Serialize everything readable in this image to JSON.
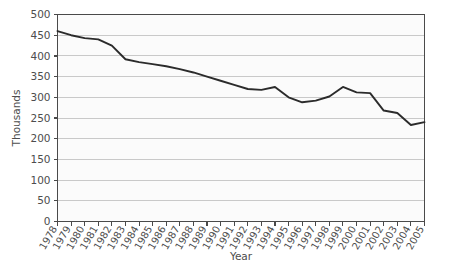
{
  "chart_data": {
    "type": "line",
    "title": "",
    "xlabel": "Year",
    "ylabel": "Thousands",
    "categories": [
      "1978",
      "1979",
      "1980",
      "1981",
      "1982",
      "1983",
      "1984",
      "1985",
      "1986",
      "1987",
      "1988",
      "1989",
      "1990",
      "1991",
      "1992",
      "1993",
      "1994",
      "1995",
      "1996",
      "1997",
      "1998",
      "1999",
      "2000",
      "2001",
      "2002",
      "2003",
      "2004",
      "2005"
    ],
    "values": [
      460,
      450,
      443,
      440,
      425,
      392,
      385,
      380,
      375,
      368,
      360,
      350,
      340,
      330,
      320,
      318,
      325,
      300,
      288,
      292,
      302,
      325,
      312,
      310,
      268,
      262,
      233,
      240
    ],
    "series": [
      {
        "name": "Series 1",
        "values": [
          460,
          450,
          443,
          440,
          425,
          392,
          385,
          380,
          375,
          368,
          360,
          350,
          340,
          330,
          320,
          318,
          325,
          300,
          288,
          292,
          302,
          325,
          312,
          310,
          268,
          262,
          233,
          240
        ]
      }
    ],
    "ylim": [
      0,
      500
    ],
    "ytick_step": 50,
    "yticks": [
      0,
      50,
      100,
      150,
      200,
      250,
      300,
      350,
      400,
      450,
      500
    ],
    "grid": true,
    "legend": "none",
    "line_color": "#2b2b2b",
    "grid_color": "#c9c9c9",
    "axis_color": "#4a4a4a",
    "plot_background": "#fbfbfb"
  },
  "axes": {
    "y_axis_title": "Thousands",
    "x_axis_title": "Year"
  }
}
